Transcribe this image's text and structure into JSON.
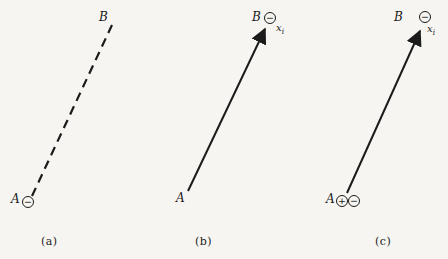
{
  "figure": {
    "colors": {
      "ink": "#1b1b1b",
      "background": "#f6f5f1"
    },
    "panels": [
      {
        "caption": "(a)",
        "start_label": "A",
        "end_label": "B",
        "line_style": "dashed",
        "has_arrowhead": false,
        "start_charges": [
          {
            "name": "minus",
            "symbol": "−"
          }
        ],
        "end_charges": [],
        "end_annotation": null
      },
      {
        "caption": "(b)",
        "start_label": "A",
        "end_label": "B",
        "line_style": "solid",
        "has_arrowhead": true,
        "start_charges": [],
        "end_charges": [
          {
            "name": "minus",
            "symbol": "−"
          }
        ],
        "end_annotation": {
          "base": "x",
          "sub": "i"
        }
      },
      {
        "caption": "(c)",
        "start_label": "A",
        "end_label": "B",
        "line_style": "solid",
        "has_arrowhead": true,
        "start_charges": [
          {
            "name": "plus",
            "symbol": "+"
          },
          {
            "name": "minus",
            "symbol": "−"
          }
        ],
        "end_charges": [
          {
            "name": "minus",
            "symbol": "−"
          }
        ],
        "end_annotation": {
          "base": "x",
          "sub": "i"
        }
      }
    ]
  }
}
